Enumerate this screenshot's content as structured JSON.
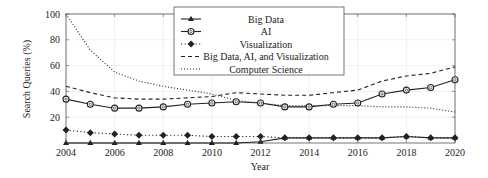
{
  "chart_data": {
    "type": "line",
    "title": "",
    "xlabel": "Year",
    "ylabel": "Search Queries (%)",
    "xlim": [
      2004,
      2020
    ],
    "ylim": [
      0,
      100
    ],
    "grid": true,
    "legend_position": "top-center",
    "x": [
      2004,
      2005,
      2006,
      2007,
      2008,
      2009,
      2010,
      2011,
      2012,
      2013,
      2014,
      2015,
      2016,
      2017,
      2018,
      2019,
      2020
    ],
    "xticks": [
      "2004",
      "2006",
      "2008",
      "2010",
      "2012",
      "2014",
      "2016",
      "2018",
      "2020"
    ],
    "yticks": [
      "20",
      "40",
      "60",
      "80",
      "100"
    ],
    "series": [
      {
        "name": "Big Data",
        "style": "solid",
        "marker": "triangle",
        "values": [
          0,
          0,
          0,
          0,
          0,
          0,
          0,
          0,
          1,
          4,
          4,
          4,
          4,
          4,
          5,
          4,
          4
        ]
      },
      {
        "name": "AI",
        "style": "solid",
        "marker": "circle",
        "values": [
          34,
          30,
          27,
          27,
          28,
          30,
          31,
          32,
          31,
          28,
          28,
          30,
          31,
          38,
          41,
          43,
          49
        ]
      },
      {
        "name": "Visualization",
        "style": "dotted",
        "marker": "diamond",
        "values": [
          10,
          8,
          7,
          6,
          6,
          6,
          5,
          5,
          5,
          4,
          4,
          4,
          4,
          4,
          5,
          4,
          4
        ]
      },
      {
        "name": "Big Data, AI, and Visualization",
        "style": "dashed",
        "marker": "none",
        "values": [
          44,
          39,
          35,
          34,
          34,
          35,
          36,
          39,
          38,
          37,
          37,
          39,
          41,
          48,
          52,
          54,
          59
        ]
      },
      {
        "name": "Computer Science",
        "style": "densely-dotted",
        "marker": "none",
        "values": [
          100,
          72,
          55,
          48,
          44,
          41,
          38,
          33,
          31,
          29,
          29,
          29,
          29,
          28,
          28,
          27,
          24
        ]
      }
    ]
  }
}
